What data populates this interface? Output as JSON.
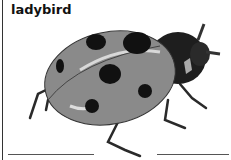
{
  "label": {
    "text": "ladybird"
  },
  "illustration": {
    "subject": "ladybird-beetle",
    "colors": {
      "shell": "#8a8a8a",
      "spots": "#111111",
      "head": "#1e1e1e",
      "highlight": "#d8d8d8"
    }
  },
  "answer_lines": [
    {
      "position": "left"
    },
    {
      "position": "right"
    }
  ]
}
